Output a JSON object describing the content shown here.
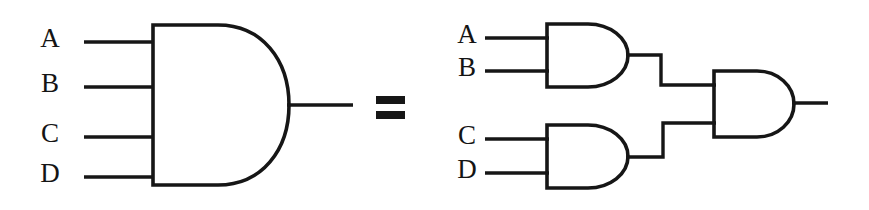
{
  "figure": {
    "background_color": "#ffffff",
    "line_color": "#161616",
    "text_color": "#141414",
    "relation_symbol": "=",
    "relation_symbol_name": "equals-sign"
  },
  "left_circuit": {
    "name": "four-input-and-gate",
    "gate_type": "AND",
    "input_count": 4,
    "inputs": [
      {
        "label": "A",
        "label_x": 50,
        "label_y": 41,
        "wire_y": 42,
        "wire_x1": 84,
        "wire_x2": 154
      },
      {
        "label": "B",
        "label_x": 50,
        "label_y": 86,
        "wire_y": 87,
        "wire_x1": 84,
        "wire_x2": 154
      },
      {
        "label": "C",
        "label_x": 50,
        "label_y": 136,
        "wire_y": 137,
        "wire_x1": 84,
        "wire_x2": 154
      },
      {
        "label": "D",
        "label_x": 50,
        "label_y": 176,
        "wire_y": 177,
        "wire_x1": 84,
        "wire_x2": 154
      }
    ],
    "gate_box": {
      "left": 153,
      "top": 25,
      "bottom": 185,
      "flat_right": 218,
      "tip_x": 289
    },
    "output": {
      "wire_y": 105,
      "wire_x1": 287,
      "wire_x2": 353
    }
  },
  "right_circuit": {
    "name": "cascaded-two-input-and-gates",
    "gate_type": "AND",
    "gate_count": 3,
    "gates": [
      {
        "id": "and-gate-ab",
        "inputs": [
          {
            "label": "A",
            "label_x": 467,
            "label_y": 37,
            "wire_y": 38,
            "wire_x1": 485,
            "wire_x2": 548
          },
          {
            "label": "B",
            "label_x": 467,
            "label_y": 70,
            "wire_y": 71,
            "wire_x1": 485,
            "wire_x2": 548
          }
        ],
        "gate_box": {
          "left": 547,
          "top": 24,
          "bottom": 87,
          "flat_right": 588,
          "tip_x": 628
        },
        "output": {
          "wire_y": 55
        }
      },
      {
        "id": "and-gate-cd",
        "inputs": [
          {
            "label": "C",
            "label_x": 467,
            "label_y": 138,
            "wire_y": 139,
            "wire_x1": 485,
            "wire_x2": 548
          },
          {
            "label": "D",
            "label_x": 467,
            "label_y": 172,
            "wire_y": 173,
            "wire_x1": 485,
            "wire_x2": 548
          }
        ],
        "gate_box": {
          "left": 547,
          "top": 125,
          "bottom": 188,
          "flat_right": 588,
          "tip_x": 628
        },
        "output": {
          "wire_y": 157
        }
      },
      {
        "id": "and-gate-final",
        "inputs": [
          {
            "wire_y": 85,
            "wire_x1": 661,
            "wire_x2": 715
          },
          {
            "wire_y": 123,
            "wire_x1": 663,
            "wire_x2": 715
          }
        ],
        "gate_box": {
          "left": 714,
          "top": 71,
          "bottom": 137,
          "flat_right": 757,
          "tip_x": 794
        },
        "output": {
          "wire_y": 103,
          "wire_x1": 792,
          "wire_x2": 828
        }
      }
    ],
    "interconnects": [
      {
        "id": "wire-ab-to-final",
        "path": "M 627 55 L 661 55 L 661 85 L 715 85"
      },
      {
        "id": "wire-cd-to-final",
        "path": "M 627 157 L 663 157 L 663 123 L 715 123"
      }
    ]
  },
  "equals": {
    "x": 376,
    "top_bar_y": 96,
    "bottom_bar_y": 111,
    "width": 29,
    "bar_height": 8
  }
}
